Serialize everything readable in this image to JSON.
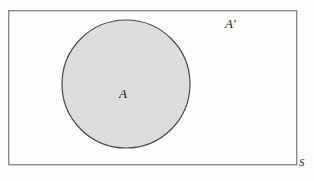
{
  "figure": {
    "type": "venn-diagram",
    "background_color": "#fdfdfc"
  },
  "universal_set": {
    "label": "S",
    "shape": "rectangle",
    "x": 8,
    "y": 10,
    "width": 289,
    "height": 155,
    "stroke_color": "#8a8a8a",
    "fill_color": "#fdfdfc",
    "stroke_width": 1.4,
    "label_position": "outside-bottom-right"
  },
  "set_a": {
    "label": "A",
    "shape": "circle",
    "cx": 126,
    "cy": 84,
    "r": 64,
    "fill_color": "#dcdcda",
    "stroke_color": "#4a4a4a",
    "stroke_width": 1.2,
    "label_position": "inside-center"
  },
  "complement": {
    "label": "A′",
    "description": "region inside rectangle but outside circle",
    "fill_color": "#fdfdfc",
    "label_position": "upper-right"
  }
}
